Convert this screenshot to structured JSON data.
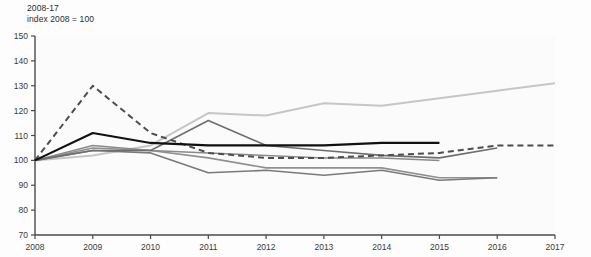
{
  "header": {
    "title": "2008-17",
    "subtitle": "index 2008 = 100"
  },
  "chart_data": {
    "type": "line",
    "title": "2008-17",
    "subtitle": "index 2008 = 100",
    "xlabel": "",
    "ylabel": "index 2008 = 100",
    "x": [
      2008,
      2009,
      2010,
      2011,
      2012,
      2013,
      2014,
      2015,
      2016,
      2017
    ],
    "categories": [
      "2008",
      "2009",
      "2010",
      "2011",
      "2012",
      "2013",
      "2014",
      "2015",
      "2016",
      "2017"
    ],
    "xlim": [
      2008,
      2017
    ],
    "ylim": [
      70,
      150
    ],
    "yticks": [
      70,
      80,
      90,
      100,
      110,
      120,
      130,
      140,
      150
    ],
    "xticks": [
      "2008",
      "2009",
      "2010",
      "2011",
      "2012",
      "2013",
      "2014",
      "2015",
      "2016",
      "2017"
    ],
    "grid": false,
    "legend": "none",
    "series": [
      {
        "name": "series-dashed-dark",
        "style": "dashed",
        "color": "#4d4d4d",
        "width": 2.0,
        "values": [
          100,
          130,
          111,
          103,
          101,
          101,
          102,
          103,
          106,
          106
        ]
      },
      {
        "name": "series-black-thick",
        "style": "solid",
        "color": "#111111",
        "width": 2.2,
        "values": [
          100,
          111,
          107,
          106,
          106,
          106,
          107,
          107,
          null,
          null
        ]
      },
      {
        "name": "series-light-gray-rising",
        "style": "solid",
        "color": "#c6c6c6",
        "width": 2.0,
        "values": [
          100,
          102,
          106,
          119,
          118,
          123,
          122,
          125,
          128,
          131
        ]
      },
      {
        "name": "series-gray-peak-2011",
        "style": "solid",
        "color": "#6e6e6e",
        "width": 1.6,
        "values": [
          100,
          104,
          104,
          116,
          106,
          104,
          102,
          101,
          105,
          null
        ]
      },
      {
        "name": "series-gray-dip-2011",
        "style": "solid",
        "color": "#7a7a7a",
        "width": 1.6,
        "values": [
          100,
          104,
          103,
          95,
          96,
          94,
          96,
          92,
          93,
          null
        ]
      },
      {
        "name": "series-gray-flat-low",
        "style": "solid",
        "color": "#909090",
        "width": 1.6,
        "values": [
          100,
          105,
          104,
          101,
          97,
          97,
          97,
          93,
          93,
          null
        ]
      },
      {
        "name": "series-gray-mid",
        "style": "solid",
        "color": "#8a8a8a",
        "width": 1.5,
        "values": [
          100,
          106,
          104,
          103,
          102,
          101,
          101,
          100,
          null,
          null
        ]
      }
    ]
  }
}
